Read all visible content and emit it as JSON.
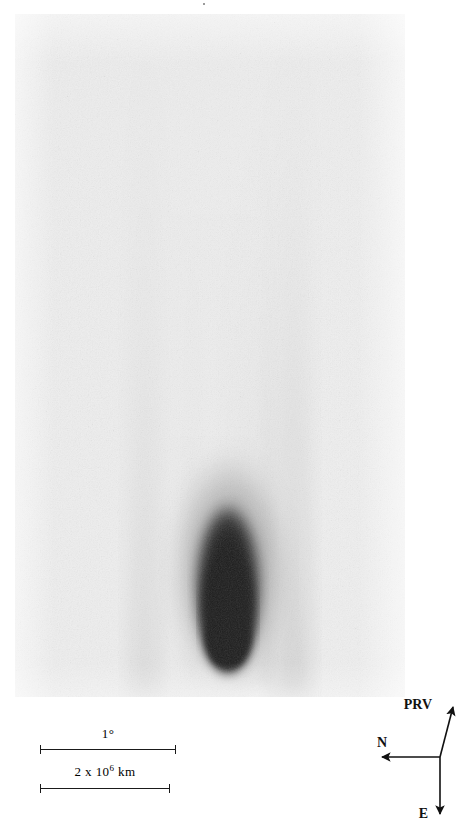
{
  "figure": {
    "type": "astronomical-plate-photograph",
    "presentation": "photographic negative (dark comet on light sky)",
    "plate": {
      "left": 15,
      "top": 14,
      "width": 390,
      "height": 683,
      "background_color": "#e9e9e9",
      "star_trail_color": "#4a4a4a",
      "star_trail_angle_deg": 35
    },
    "comet": {
      "coma_center_x": 228,
      "coma_tip_y": 665,
      "coma_color": "#000000",
      "tail_direction": "up",
      "tail_fade_top_y": 40
    }
  },
  "scalebars": [
    {
      "id": "angular-scale",
      "label_text": "1",
      "label_unit": "°",
      "label_superscript": "",
      "left": 40,
      "top": 745,
      "width": 136,
      "label_top": 727
    },
    {
      "id": "linear-scale",
      "label_text": "2 x 10",
      "label_superscript": "6",
      "label_unit": " km",
      "left": 40,
      "top": 784,
      "width": 130,
      "label_top": 765
    }
  ],
  "compass": {
    "origin": {
      "x": 80,
      "y": 65
    },
    "arrows": [
      {
        "name": "prv",
        "label": "PRV",
        "tip": {
          "x": 93,
          "y": 11
        },
        "label_x": 72,
        "label_y": 17,
        "label_anchor": "end"
      },
      {
        "name": "north",
        "label": "N",
        "tip": {
          "x": 18,
          "y": 65
        },
        "label_x": 22,
        "label_y": 55,
        "label_anchor": "middle"
      },
      {
        "name": "east",
        "label": "E",
        "tip": {
          "x": 80,
          "y": 126
        },
        "label_x": 68,
        "label_y": 125,
        "label_anchor": "end"
      }
    ],
    "stroke_color": "#111111"
  }
}
